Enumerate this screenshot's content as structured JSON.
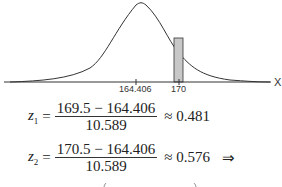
{
  "graph": {
    "axis_label": "X",
    "mean_label": "164.406",
    "value_label": "170",
    "shaded_interval": [
      169.5,
      170.5
    ]
  },
  "equations": [
    {
      "var": "z",
      "sub": "1",
      "numerator": "169.5 − 164.406",
      "denominator": "10.589",
      "relation": "≈ 0.481",
      "suffix": ""
    },
    {
      "var": "z",
      "sub": "2",
      "numerator": "170.5 − 164.406",
      "denominator": "10.589",
      "relation": "≈ 0.576",
      "suffix": "⇒"
    }
  ]
}
